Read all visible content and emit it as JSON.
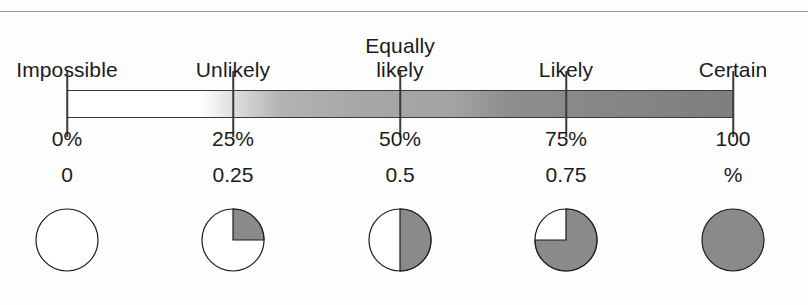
{
  "figure": {
    "kind": "probability-scale",
    "colors": {
      "ink": "#1b1b1b",
      "rule": "#9b9b9b",
      "shade": "#8a8a8a",
      "bar_start": "#ffffff",
      "bar_end": "#7e7e7e"
    }
  },
  "scale": {
    "x_left": 67,
    "x_right": 733,
    "positions": [
      67,
      233,
      400,
      566,
      733
    ]
  },
  "chart_data": {
    "type": "bar",
    "title": "",
    "xlabel": "",
    "ylabel": "",
    "grid": false,
    "legend": "none",
    "xlim": [
      0,
      100
    ],
    "categories": [
      "Impossible",
      "Unlikely",
      "Equally likely",
      "Likely",
      "Certain"
    ],
    "percent_labels": [
      "0%",
      "25%",
      "50%",
      "75%",
      "100"
    ],
    "decimal_labels": [
      "0",
      "0.25",
      "0.5",
      "0.75",
      "%"
    ],
    "values": [
      0,
      25,
      50,
      75,
      100
    ],
    "probabilities": [
      0,
      0.25,
      0.5,
      0.75,
      1
    ],
    "pie_fractions": [
      0,
      0.25,
      0.5,
      0.75,
      1
    ]
  },
  "labels": {
    "words": [
      {
        "text": "Impossible",
        "x": 67
      },
      {
        "text": "Unlikely",
        "x": 233
      },
      {
        "text": "Equally\nlikely",
        "x": 400
      },
      {
        "text": "Likely",
        "x": 566
      },
      {
        "text": "Certain",
        "x": 733
      }
    ],
    "percents": [
      {
        "text": "0%",
        "x": 67
      },
      {
        "text": "25%",
        "x": 233
      },
      {
        "text": "50%",
        "x": 400
      },
      {
        "text": "75%",
        "x": 566
      },
      {
        "text": "100",
        "x": 733
      }
    ],
    "decimals": [
      {
        "text": "0",
        "x": 67
      },
      {
        "text": "0.25",
        "x": 233
      },
      {
        "text": "0.5",
        "x": 400
      },
      {
        "text": "0.75",
        "x": 566
      },
      {
        "text": "%",
        "x": 733
      }
    ]
  },
  "pies": [
    {
      "fraction": 0,
      "x": 67,
      "name": "pie-0"
    },
    {
      "fraction": 0.25,
      "x": 233,
      "name": "pie-25"
    },
    {
      "fraction": 0.5,
      "x": 400,
      "name": "pie-50"
    },
    {
      "fraction": 0.75,
      "x": 566,
      "name": "pie-75"
    },
    {
      "fraction": 1,
      "x": 733,
      "name": "pie-100"
    }
  ]
}
